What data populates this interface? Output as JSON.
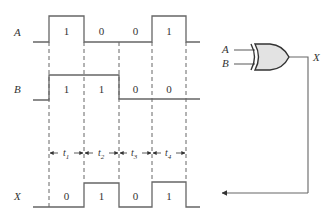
{
  "diagram": {
    "type": "timing-diagram",
    "gate": {
      "type": "XOR",
      "inputs": [
        "A",
        "B"
      ],
      "output": "X"
    },
    "signals": [
      {
        "name": "A",
        "bits": [
          "1",
          "0",
          "0",
          "1"
        ]
      },
      {
        "name": "B",
        "bits": [
          "1",
          "1",
          "0",
          "0"
        ]
      },
      {
        "name": "X",
        "bits": [
          "0",
          "1",
          "0",
          "1"
        ]
      }
    ],
    "intervals": [
      {
        "label": "t",
        "sub": "1"
      },
      {
        "label": "t",
        "sub": "2"
      },
      {
        "label": "t",
        "sub": "3"
      },
      {
        "label": "t",
        "sub": "4"
      }
    ],
    "gate_labels": {
      "in_a": "A",
      "in_b": "B",
      "out": "X"
    }
  }
}
